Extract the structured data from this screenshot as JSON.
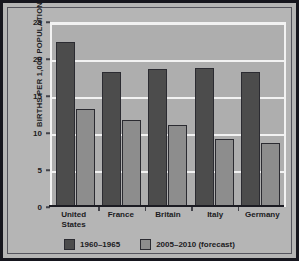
{
  "chart_data": {
    "type": "bar",
    "title": "",
    "xlabel": "",
    "ylabel": "BIRTHS PER 1,000 POPULATION",
    "ylim": [
      0,
      25
    ],
    "yticks": [
      0,
      5,
      10,
      15,
      20,
      25
    ],
    "grid": true,
    "legend_position": "bottom",
    "categories": [
      "United States",
      "France",
      "Britain",
      "Italy",
      "Germany"
    ],
    "category_lines": [
      [
        "United",
        "States"
      ],
      [
        "France"
      ],
      [
        "Britain"
      ],
      [
        "Italy"
      ],
      [
        "Germany"
      ]
    ],
    "series": [
      {
        "name": "1960–1965",
        "color": "#4c4c4c",
        "values": [
          22.3,
          18.2,
          18.6,
          18.8,
          18.3
        ]
      },
      {
        "name": "2005–2010 (forecast)",
        "color": "#8d8d8d",
        "values": [
          13.3,
          11.7,
          11.1,
          9.2,
          8.6
        ]
      }
    ]
  },
  "figure": {
    "border_color": "#16161e",
    "background": "#b5b5b5",
    "plot_background": "#aeaeae",
    "gridline_color": "#f2f2f2"
  }
}
